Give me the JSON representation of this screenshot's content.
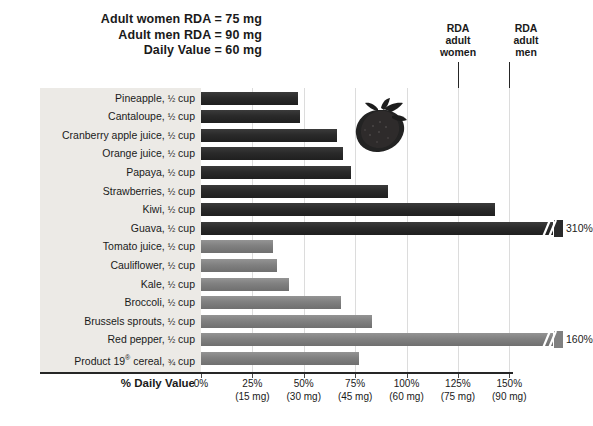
{
  "header": {
    "lines": [
      "Adult women RDA = 75 mg",
      "Adult men RDA = 90 mg",
      "Daily Value = 60 mg"
    ]
  },
  "annotations": {
    "rda_women": "RDA\nadult\nwomen",
    "rda_women_l1": "RDA",
    "rda_women_l2": "adult",
    "rda_women_l3": "women",
    "rda_men_l1": "RDA",
    "rda_men_l2": "adult",
    "rda_men_l3": "men",
    "rda_women_value_pct": 125,
    "rda_men_value_pct": 150
  },
  "axis": {
    "title": "% Daily Value",
    "ticks": [
      {
        "pct": "0%",
        "mg": ""
      },
      {
        "pct": "25%",
        "mg": "(15 mg)"
      },
      {
        "pct": "50%",
        "mg": "(30 mg)"
      },
      {
        "pct": "75%",
        "mg": "(45 mg)"
      },
      {
        "pct": "100%",
        "mg": "(60 mg)"
      },
      {
        "pct": "125%",
        "mg": "(75 mg)"
      },
      {
        "pct": "150%",
        "mg": "(90 mg)"
      }
    ]
  },
  "decorations": {
    "strawberry_icon": "strawberry-photo"
  },
  "colors": {
    "bar_fruit": "#2a2a2a",
    "bar_vegetable": "#808080",
    "label_panel": "#eceae6",
    "axis": "#262626",
    "grid": "#dcdcdc"
  },
  "chart_data": {
    "type": "bar",
    "orientation": "horizontal",
    "xlabel": "% Daily Value",
    "ylabel": "",
    "xlim": [
      0,
      155
    ],
    "grid": true,
    "legend": "none",
    "categories": [
      "Pineapple, ½ cup",
      "Cantaloupe, ½ cup",
      "Cranberry apple juice, ½ cup",
      "Orange juice, ½ cup",
      "Papaya, ½ cup",
      "Strawberries, ½ cup",
      "Kiwi, ½ cup",
      "Guava, ½ cup",
      "Tomato juice, ½ cup",
      "Cauliflower, ½ cup",
      "Kale, ½ cup",
      "Broccoli, ½ cup",
      "Brussels sprouts, ½ cup",
      "Red pepper, ½ cup",
      "Product 19® cereal, ¾ cup"
    ],
    "values": [
      47,
      48,
      66,
      69,
      73,
      91,
      143,
      310,
      35,
      37,
      43,
      68,
      83,
      160,
      77
    ],
    "bars": [
      {
        "label_html": "Pineapple, <span class=\"frac\">½</span> cup",
        "value": 47,
        "group": "fruit",
        "truncated": false,
        "value_label": ""
      },
      {
        "label_html": "Cantaloupe, <span class=\"frac\">½</span> cup",
        "value": 48,
        "group": "fruit",
        "truncated": false,
        "value_label": ""
      },
      {
        "label_html": "Cranberry apple juice, <span class=\"frac\">½</span> cup",
        "value": 66,
        "group": "fruit",
        "truncated": false,
        "value_label": ""
      },
      {
        "label_html": "Orange juice, <span class=\"frac\">½</span> cup",
        "value": 69,
        "group": "fruit",
        "truncated": false,
        "value_label": ""
      },
      {
        "label_html": "Papaya, <span class=\"frac\">½</span> cup",
        "value": 73,
        "group": "fruit",
        "truncated": false,
        "value_label": ""
      },
      {
        "label_html": "Strawberries, <span class=\"frac\">½</span> cup",
        "value": 91,
        "group": "fruit",
        "truncated": false,
        "value_label": ""
      },
      {
        "label_html": "Kiwi, <span class=\"frac\">½</span> cup",
        "value": 143,
        "group": "fruit",
        "truncated": false,
        "value_label": ""
      },
      {
        "label_html": "Guava, <span class=\"frac\">½</span> cup",
        "value": 310,
        "group": "fruit",
        "truncated": true,
        "value_label": "310%"
      },
      {
        "label_html": "Tomato juice, <span class=\"frac\">½</span> cup",
        "value": 35,
        "group": "vegetable",
        "truncated": false,
        "value_label": ""
      },
      {
        "label_html": "Cauliflower, <span class=\"frac\">½</span> cup",
        "value": 37,
        "group": "vegetable",
        "truncated": false,
        "value_label": ""
      },
      {
        "label_html": "Kale, <span class=\"frac\">½</span> cup",
        "value": 43,
        "group": "vegetable",
        "truncated": false,
        "value_label": ""
      },
      {
        "label_html": "Broccoli, <span class=\"frac\">½</span> cup",
        "value": 68,
        "group": "vegetable",
        "truncated": false,
        "value_label": ""
      },
      {
        "label_html": "Brussels sprouts, <span class=\"frac\">½</span> cup",
        "value": 83,
        "group": "vegetable",
        "truncated": false,
        "value_label": ""
      },
      {
        "label_html": "Red pepper, <span class=\"frac\">½</span> cup",
        "value": 160,
        "group": "vegetable",
        "truncated": true,
        "value_label": "160%"
      },
      {
        "label_html": "Product 19<sup>®</sup> cereal, <span class=\"frac\">¾</span> cup",
        "value": 77,
        "group": "vegetable",
        "truncated": false,
        "value_label": ""
      }
    ],
    "reference_lines": [
      {
        "name": "RDA adult women",
        "value": 125
      },
      {
        "name": "RDA adult men",
        "value": 150
      }
    ]
  }
}
